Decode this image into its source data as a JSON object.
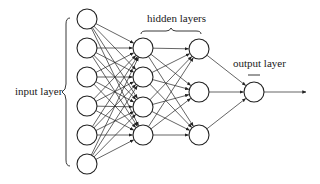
{
  "labels": {
    "input": "input layer",
    "hidden": "hidden layers",
    "output": "output layer"
  },
  "layers": [
    {
      "name": "input",
      "x": 87,
      "nodes": [
        19,
        48,
        77,
        106,
        135,
        164
      ]
    },
    {
      "name": "hidden-1",
      "x": 143,
      "nodes": [
        48,
        77,
        107,
        135
      ]
    },
    {
      "name": "hidden-2",
      "x": 199,
      "nodes": [
        49,
        92,
        135
      ]
    },
    {
      "name": "output",
      "x": 254,
      "nodes": [
        92
      ]
    }
  ],
  "node_radius": 10,
  "output_arrow_end_x": 306,
  "colors": {
    "stroke": "#222222",
    "background": "#ffffff"
  }
}
